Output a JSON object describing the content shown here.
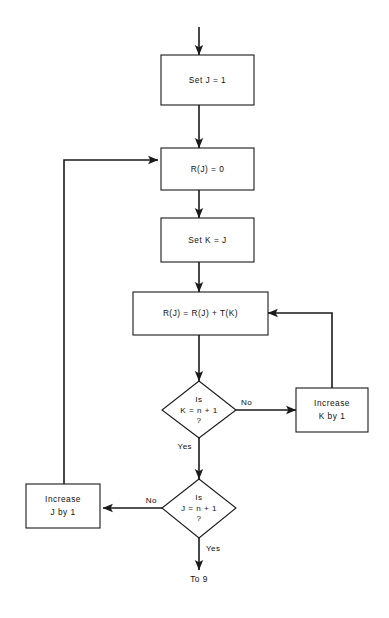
{
  "diagram": {
    "background_color": "#ffffff",
    "line_color": "#1a1a1a",
    "text_color": "#111111"
  },
  "nodes": {
    "set_j": {
      "label": "Set  J  =  1",
      "type": "process"
    },
    "rj_zero": {
      "label": "R(J)  =  0",
      "type": "process"
    },
    "set_k": {
      "label": "Set  K  =  J",
      "type": "process"
    },
    "accumulate": {
      "label": "R(J)  =  R(J)  +  T(K)",
      "type": "process"
    },
    "decision_k": {
      "type": "decision",
      "line1": "Is",
      "line2": "K  =  n  +  1",
      "line3": "?"
    },
    "decision_j": {
      "type": "decision",
      "line1": "Is",
      "line2": "J  =  n  +  1",
      "line3": "?"
    },
    "increase_k": {
      "type": "process",
      "line1": "Increase",
      "line2": "K  by  1"
    },
    "increase_j": {
      "type": "process",
      "line1": "Increase",
      "line2": "J  by  1"
    },
    "terminal": {
      "label": "To 9",
      "type": "connector"
    }
  },
  "edge_labels": {
    "k_no": "No",
    "k_yes": "Yes",
    "j_no": "No",
    "j_yes": "Yes"
  }
}
